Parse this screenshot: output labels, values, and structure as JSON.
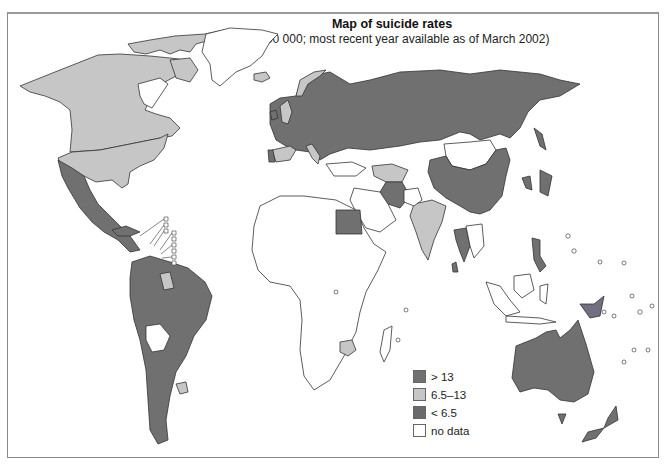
{
  "map": {
    "title": "Map of suicide rates",
    "subtitle": "(per 100 000; most recent year available as of March 2002)",
    "colors": {
      "high": "#707070",
      "medium": "#c6c6c6",
      "low": "#707070",
      "no_data": "#ffffff",
      "border": "#333333"
    },
    "legend": [
      {
        "label": "> 13",
        "class": "high",
        "color": "#707070"
      },
      {
        "label": "6.5–13",
        "class": "medium",
        "color": "#c6c6c6"
      },
      {
        "label": "< 6.5",
        "class": "low",
        "color": "#6a6a6a"
      },
      {
        "label": "no data",
        "class": "no_data",
        "color": "#ffffff"
      }
    ],
    "regions": [
      {
        "name": "North America (Canada/USA)",
        "class": "medium"
      },
      {
        "name": "Greenland",
        "class": "no_data"
      },
      {
        "name": "Mexico / Central America",
        "class": "dark"
      },
      {
        "name": "South America",
        "class": "dark"
      },
      {
        "name": "Bolivia",
        "class": "no_data"
      },
      {
        "name": "Uruguay / Guyana",
        "class": "medium"
      },
      {
        "name": "Europe / Russia",
        "class": "dark"
      },
      {
        "name": "Norway / UK / Spain / Italy",
        "class": "medium"
      },
      {
        "name": "Africa",
        "class": "no_data"
      },
      {
        "name": "Egypt",
        "class": "dark"
      },
      {
        "name": "Zimbabwe",
        "class": "medium"
      },
      {
        "name": "Iran / Middle East",
        "class": "dark"
      },
      {
        "name": "India",
        "class": "medium"
      },
      {
        "name": "China / Japan / Korea",
        "class": "dark"
      },
      {
        "name": "Mongolia",
        "class": "no_data"
      },
      {
        "name": "Southeast Asia (Thailand, Philippines)",
        "class": "dark"
      },
      {
        "name": "Indonesia",
        "class": "no_data"
      },
      {
        "name": "Papua New Guinea",
        "class": "dark"
      },
      {
        "name": "Australia / New Zealand",
        "class": "dark"
      }
    ]
  }
}
